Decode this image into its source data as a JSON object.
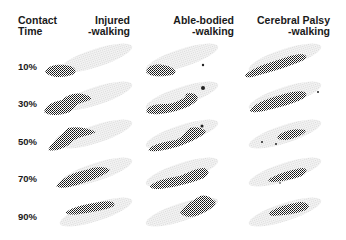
{
  "figure": {
    "header": {
      "row_axis_title_line1": "Contact",
      "row_axis_title_line2": "Time",
      "columns": [
        {
          "line1": "Injured",
          "line2": "-walking"
        },
        {
          "line1": "Able-bodied",
          "line2": "-walking"
        },
        {
          "line1": "Cerebral Palsy",
          "line2": "-walking"
        }
      ]
    },
    "rows": [
      {
        "label": "10%"
      },
      {
        "label": "30%"
      },
      {
        "label": "50%"
      },
      {
        "label": "70%"
      },
      {
        "label": "90%"
      }
    ],
    "colors": {
      "footprint_outline": "#e6e6e6",
      "pressure_mesh": "#1a1a1a"
    }
  }
}
